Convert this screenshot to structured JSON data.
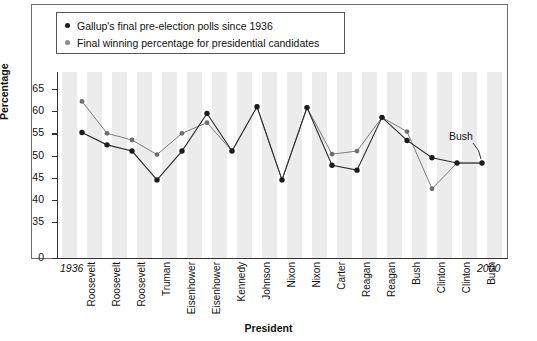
{
  "legend": {
    "items": [
      {
        "label": "Gallup's final pre-election polls since 1936",
        "marker": "dot-dark",
        "color": "#1c1c1c"
      },
      {
        "label": "Final winning percentage for presidential candidates",
        "marker": "dot-gray",
        "color": "#8b8b8b"
      }
    ]
  },
  "axes": {
    "y_title": "Percentage",
    "x_title": "President",
    "y_ticks": [
      "0",
      "35",
      "40",
      "45",
      "50",
      "55",
      "60",
      "65"
    ],
    "x_edge_left": "1936",
    "x_edge_right": "2000"
  },
  "annotations": [
    {
      "text": "Bush",
      "target": "last-point"
    }
  ],
  "source_note": "",
  "chart_data": {
    "type": "line",
    "title": "",
    "xlabel": "President",
    "ylabel": "Percentage",
    "ylim": [
      0,
      67
    ],
    "y_ticks": [
      0,
      35,
      40,
      45,
      50,
      55,
      60,
      65
    ],
    "y_axis_break": true,
    "grid": false,
    "legend_position": "top-left-inside",
    "categories": [
      "Roosevelt",
      "Roosevelt",
      "Roosevelt",
      "Truman",
      "Eisenhower",
      "Eisenhower",
      "Kennedy",
      "Johnson",
      "Nixon",
      "Nixon",
      "Carter",
      "Reagan",
      "Reagan",
      "Bush",
      "Clinton",
      "Clinton",
      "Bush"
    ],
    "series": [
      {
        "name": "Gallup's final pre-election polls since 1936",
        "color": "#1c1c1c",
        "values": [
          55.2,
          52.4,
          51.0,
          44.5,
          51.0,
          59.5,
          51.0,
          61.0,
          44.5,
          60.8,
          47.8,
          46.7,
          58.6,
          53.4,
          49.5,
          48.3,
          48.3
        ]
      },
      {
        "name": "Final winning percentage for presidential candidates",
        "color": "#8b8b8b",
        "values": [
          62.2,
          55.0,
          53.5,
          50.2,
          55.0,
          57.4,
          51.0,
          61.0,
          44.5,
          60.8,
          50.3,
          51.0,
          58.6,
          55.4,
          42.5,
          48.3,
          48.3
        ]
      }
    ]
  }
}
